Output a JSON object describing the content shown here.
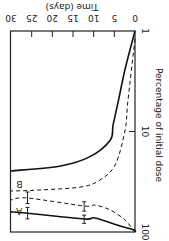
{
  "chart_data": {
    "type": "line",
    "orientation_note": "figure rotated 90 degrees",
    "xlabel": "Percentage of initial dose",
    "ylabel": "Time (days)",
    "x_scale": "log",
    "xlim": [
      1,
      100
    ],
    "ylim": [
      0,
      30
    ],
    "x_ticks": [
      "1",
      "10",
      "100"
    ],
    "y_ticks": [
      "0",
      "5",
      "10",
      "15",
      "20",
      "25",
      "30"
    ],
    "annotations": [
      "A",
      "B"
    ],
    "series": [
      {
        "name": "upper-solid",
        "style": "solid",
        "points": [
          [
            0,
            1.0
          ],
          [
            2.4,
            2.4
          ],
          [
            4,
            4.9
          ],
          [
            5.3,
            8.6
          ],
          [
            6,
            12.2
          ],
          [
            11,
            17.9
          ],
          [
            18,
            22
          ],
          [
            30,
            24.7
          ]
        ]
      },
      {
        "name": "upper-dashed",
        "style": "dashed",
        "points": [
          [
            0,
            1.2
          ],
          [
            1.7,
            4.9
          ],
          [
            2.4,
            9.7
          ],
          [
            4.8,
            21.5
          ],
          [
            8.5,
            30.4
          ],
          [
            13,
            35.6
          ],
          [
            23,
            38.2
          ],
          [
            30,
            39.1
          ]
        ]
      },
      {
        "name": "lower-dashed",
        "style": "dashed",
        "points": [
          [
            0,
            100
          ],
          [
            0.5,
            95.5
          ],
          [
            2.4,
            75.9
          ],
          [
            6,
            60.3
          ],
          [
            9.7,
            54
          ],
          [
            12.3,
            55.1
          ],
          [
            26,
            45.9
          ],
          [
            30,
            48
          ]
        ],
        "error_bars": [
          {
            "t": 12.3,
            "low": 50,
            "high": 62
          },
          {
            "t": 26,
            "low": 40,
            "high": 52
          }
        ]
      },
      {
        "name": "lower-solid",
        "style": "solid",
        "points": [
          [
            0,
            100
          ],
          [
            0.2,
            95.5
          ],
          [
            3.6,
            87
          ],
          [
            9.7,
            72.5
          ],
          [
            12.3,
            74.2
          ],
          [
            26,
            65
          ],
          [
            30,
            63.1
          ]
        ],
        "error_bars": [
          {
            "t": 12.3,
            "low": 68,
            "high": 82
          },
          {
            "t": 26,
            "low": 57,
            "high": 74
          }
        ]
      }
    ],
    "labels": [
      {
        "text": "A",
        "near": "lower pair",
        "t": 28,
        "p": 62
      },
      {
        "text": "B",
        "near": "upper pair",
        "t": 28,
        "p": 33
      }
    ]
  }
}
